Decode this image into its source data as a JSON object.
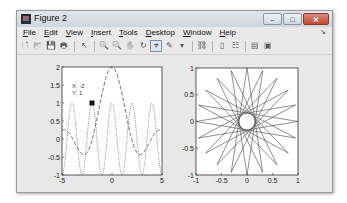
{
  "window": {
    "title": "Figure 2",
    "controls": [
      "minimize",
      "maximize",
      "close"
    ]
  },
  "menubar": {
    "items": [
      {
        "label": "File",
        "mnemonic": "F",
        "rest": "ile"
      },
      {
        "label": "Edit",
        "mnemonic": "E",
        "rest": "dit"
      },
      {
        "label": "View",
        "mnemonic": "V",
        "rest": "iew"
      },
      {
        "label": "Insert",
        "mnemonic": "I",
        "rest": "nsert"
      },
      {
        "label": "Tools",
        "mnemonic": "T",
        "rest": "ools"
      },
      {
        "label": "Desktop",
        "mnemonic": "D",
        "rest": "esktop"
      },
      {
        "label": "Window",
        "mnemonic": "W",
        "rest": "indow"
      },
      {
        "label": "Help",
        "mnemonic": "H",
        "rest": "elp"
      }
    ],
    "dock_glyph": "↘"
  },
  "toolbar": {
    "buttons": [
      {
        "name": "new-figure",
        "glyph": "🗋"
      },
      {
        "name": "open-file",
        "glyph": "📂"
      },
      {
        "name": "save-figure",
        "glyph": "💾"
      },
      {
        "name": "print-figure",
        "glyph": "🖶"
      },
      {
        "sep": true
      },
      {
        "name": "edit-plot",
        "glyph": "↖"
      },
      {
        "sep": true
      },
      {
        "name": "zoom-in",
        "glyph": "🔍"
      },
      {
        "name": "zoom-out",
        "glyph": "🔍"
      },
      {
        "name": "pan",
        "glyph": "✋"
      },
      {
        "name": "rotate-3d",
        "glyph": "↻"
      },
      {
        "name": "data-cursor",
        "glyph": "⌖",
        "active": true
      },
      {
        "name": "brush",
        "glyph": "✎"
      },
      {
        "name": "brush-dropdown",
        "glyph": "▾"
      },
      {
        "sep": true
      },
      {
        "name": "link-plot",
        "glyph": "⛓"
      },
      {
        "sep": true
      },
      {
        "name": "insert-colorbar",
        "glyph": "▯"
      },
      {
        "name": "insert-legend",
        "glyph": "☷"
      },
      {
        "sep": true
      },
      {
        "name": "hide-plot-tools",
        "glyph": "▤"
      },
      {
        "name": "show-plot-tools",
        "glyph": "▣"
      }
    ]
  },
  "chart_data": [
    {
      "type": "line",
      "title": "",
      "xlabel": "",
      "ylabel": "",
      "xlim": [
        -5,
        5
      ],
      "ylim": [
        -1,
        2
      ],
      "xticks": [
        "-5",
        "0",
        "5"
      ],
      "yticks": [
        "-1",
        "-0.5",
        "0",
        "0.5",
        "1",
        "1.5",
        "2"
      ],
      "grid": false,
      "series": [
        {
          "name": "dotted",
          "style": "dotted",
          "formula": "cos(pi*x)",
          "peaks_at": [
            -4,
            -2,
            0,
            2,
            4
          ],
          "range": [
            -1,
            1
          ]
        },
        {
          "name": "dashed",
          "style": "dashed",
          "formula": "2*sinc-like",
          "peak": [
            0,
            2
          ],
          "min_near": [
            [
              -1.2,
              -0.45
            ],
            [
              1.2,
              -0.45
            ]
          ],
          "tail_amplitude": 0.2
        }
      ],
      "datatip": {
        "x_label": "X: -2",
        "y_label": "Y: 1",
        "x": -2,
        "y": 1
      }
    },
    {
      "type": "line",
      "title": "",
      "xlabel": "",
      "ylabel": "",
      "xlim": [
        -1,
        1
      ],
      "ylim": [
        -1,
        1
      ],
      "xticks": [
        "-1",
        "-0.5",
        "0",
        "0.5",
        "1"
      ],
      "yticks": [
        "-1",
        "-0.5",
        "0",
        "0.5",
        "1"
      ],
      "grid": false,
      "series": [
        {
          "name": "star-polygon",
          "style": "solid",
          "points": 20,
          "step": 9,
          "radius": 1,
          "inner_clear_radius": 0.15
        }
      ]
    }
  ]
}
